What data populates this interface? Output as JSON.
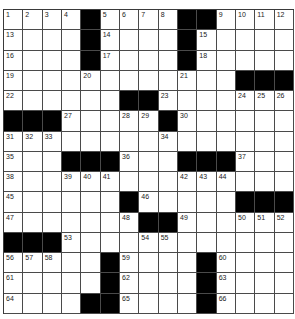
{
  "puzzle": {
    "rows": 15,
    "cols": 15,
    "colors": {
      "block": "#000000",
      "cell": "#ffffff",
      "line": "#4a4a4a"
    },
    "blocks": [
      [
        0,
        4
      ],
      [
        0,
        9
      ],
      [
        0,
        10
      ],
      [
        1,
        4
      ],
      [
        1,
        9
      ],
      [
        2,
        4
      ],
      [
        2,
        9
      ],
      [
        3,
        12
      ],
      [
        3,
        13
      ],
      [
        3,
        14
      ],
      [
        4,
        6
      ],
      [
        4,
        7
      ],
      [
        5,
        0
      ],
      [
        5,
        1
      ],
      [
        5,
        2
      ],
      [
        5,
        8
      ],
      [
        7,
        3
      ],
      [
        7,
        4
      ],
      [
        7,
        5
      ],
      [
        7,
        9
      ],
      [
        7,
        10
      ],
      [
        7,
        11
      ],
      [
        9,
        6
      ],
      [
        9,
        12
      ],
      [
        9,
        13
      ],
      [
        9,
        14
      ],
      [
        10,
        7
      ],
      [
        10,
        8
      ],
      [
        11,
        0
      ],
      [
        11,
        1
      ],
      [
        11,
        2
      ],
      [
        12,
        5
      ],
      [
        12,
        10
      ],
      [
        13,
        5
      ],
      [
        13,
        10
      ],
      [
        14,
        4
      ],
      [
        14,
        5
      ],
      [
        14,
        10
      ]
    ],
    "numbers": [
      {
        "r": 0,
        "c": 0,
        "n": "1"
      },
      {
        "r": 0,
        "c": 1,
        "n": "2"
      },
      {
        "r": 0,
        "c": 2,
        "n": "3"
      },
      {
        "r": 0,
        "c": 3,
        "n": "4"
      },
      {
        "r": 0,
        "c": 5,
        "n": "5"
      },
      {
        "r": 0,
        "c": 6,
        "n": "6"
      },
      {
        "r": 0,
        "c": 7,
        "n": "7"
      },
      {
        "r": 0,
        "c": 8,
        "n": "8"
      },
      {
        "r": 0,
        "c": 11,
        "n": "9"
      },
      {
        "r": 0,
        "c": 12,
        "n": "10"
      },
      {
        "r": 0,
        "c": 13,
        "n": "11"
      },
      {
        "r": 0,
        "c": 14,
        "n": "12"
      },
      {
        "r": 1,
        "c": 0,
        "n": "13"
      },
      {
        "r": 1,
        "c": 5,
        "n": "14"
      },
      {
        "r": 1,
        "c": 10,
        "n": "15"
      },
      {
        "r": 2,
        "c": 0,
        "n": "16"
      },
      {
        "r": 2,
        "c": 5,
        "n": "17"
      },
      {
        "r": 2,
        "c": 10,
        "n": "18"
      },
      {
        "r": 3,
        "c": 0,
        "n": "19"
      },
      {
        "r": 3,
        "c": 4,
        "n": "20"
      },
      {
        "r": 3,
        "c": 9,
        "n": "21"
      },
      {
        "r": 4,
        "c": 0,
        "n": "22"
      },
      {
        "r": 4,
        "c": 8,
        "n": "23"
      },
      {
        "r": 4,
        "c": 12,
        "n": "24"
      },
      {
        "r": 4,
        "c": 13,
        "n": "25"
      },
      {
        "r": 4,
        "c": 14,
        "n": "26"
      },
      {
        "r": 5,
        "c": 3,
        "n": "27"
      },
      {
        "r": 5,
        "c": 6,
        "n": "28"
      },
      {
        "r": 5,
        "c": 7,
        "n": "29"
      },
      {
        "r": 5,
        "c": 9,
        "n": "30"
      },
      {
        "r": 6,
        "c": 0,
        "n": "31"
      },
      {
        "r": 6,
        "c": 1,
        "n": "32"
      },
      {
        "r": 6,
        "c": 2,
        "n": "33"
      },
      {
        "r": 6,
        "c": 8,
        "n": "34"
      },
      {
        "r": 7,
        "c": 0,
        "n": "35"
      },
      {
        "r": 7,
        "c": 6,
        "n": "36"
      },
      {
        "r": 7,
        "c": 12,
        "n": "37"
      },
      {
        "r": 8,
        "c": 0,
        "n": "38"
      },
      {
        "r": 8,
        "c": 3,
        "n": "39"
      },
      {
        "r": 8,
        "c": 4,
        "n": "40"
      },
      {
        "r": 8,
        "c": 5,
        "n": "41"
      },
      {
        "r": 8,
        "c": 9,
        "n": "42"
      },
      {
        "r": 8,
        "c": 10,
        "n": "43"
      },
      {
        "r": 8,
        "c": 11,
        "n": "44"
      },
      {
        "r": 9,
        "c": 0,
        "n": "45"
      },
      {
        "r": 9,
        "c": 7,
        "n": "46"
      },
      {
        "r": 10,
        "c": 0,
        "n": "47"
      },
      {
        "r": 10,
        "c": 6,
        "n": "48"
      },
      {
        "r": 10,
        "c": 9,
        "n": "49"
      },
      {
        "r": 10,
        "c": 12,
        "n": "50"
      },
      {
        "r": 10,
        "c": 13,
        "n": "51"
      },
      {
        "r": 10,
        "c": 14,
        "n": "52"
      },
      {
        "r": 11,
        "c": 3,
        "n": "53"
      },
      {
        "r": 11,
        "c": 7,
        "n": "54"
      },
      {
        "r": 11,
        "c": 8,
        "n": "55"
      },
      {
        "r": 12,
        "c": 0,
        "n": "56"
      },
      {
        "r": 12,
        "c": 1,
        "n": "57"
      },
      {
        "r": 12,
        "c": 2,
        "n": "58"
      },
      {
        "r": 12,
        "c": 6,
        "n": "59"
      },
      {
        "r": 12,
        "c": 11,
        "n": "60"
      },
      {
        "r": 13,
        "c": 0,
        "n": "61"
      },
      {
        "r": 13,
        "c": 6,
        "n": "62"
      },
      {
        "r": 13,
        "c": 11,
        "n": "63"
      },
      {
        "r": 14,
        "c": 0,
        "n": "64"
      },
      {
        "r": 14,
        "c": 6,
        "n": "65"
      },
      {
        "r": 14,
        "c": 11,
        "n": "66"
      }
    ]
  }
}
